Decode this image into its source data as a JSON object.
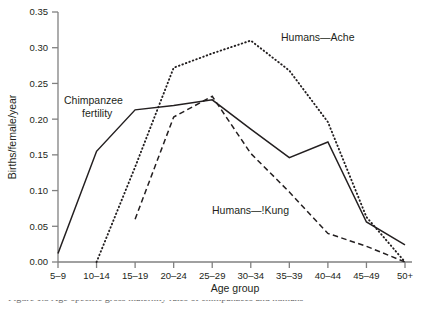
{
  "chart_data": {
    "type": "line",
    "title": "",
    "xlabel": "Age group",
    "ylabel": "Births/female/year",
    "categories": [
      "5–9",
      "10–14",
      "15–19",
      "20–24",
      "25–29",
      "30–34",
      "35–39",
      "40–44",
      "45–49",
      "50+"
    ],
    "ylim": [
      0.0,
      0.35
    ],
    "yticks": [
      "0.00",
      "0.05",
      "0.10",
      "0.15",
      "0.20",
      "0.25",
      "0.30",
      "0.35"
    ],
    "ytick_values": [
      0.0,
      0.05,
      0.1,
      0.15,
      0.2,
      0.25,
      0.3,
      0.35
    ],
    "grid": false,
    "legend_position": "inline-annotations",
    "series": [
      {
        "name": "Chimpanzee fertility",
        "style": "solid",
        "color": "#231f20",
        "x": [
          "5–9",
          "10–14",
          "15–19",
          "20–24",
          "25–29",
          "30–34",
          "35–39",
          "40–44",
          "45–49",
          "50+"
        ],
        "values": [
          0.012,
          0.155,
          0.213,
          0.219,
          0.227,
          0.186,
          0.146,
          0.168,
          0.056,
          0.024
        ]
      },
      {
        "name": "Humans—Ache",
        "style": "dotted",
        "color": "#231f20",
        "x": [
          "10–14",
          "15–19",
          "20–24",
          "25–29",
          "30–34",
          "35–39",
          "40–44",
          "45–49",
          "50+"
        ],
        "values": [
          0.0,
          0.133,
          0.272,
          0.292,
          0.31,
          0.268,
          0.196,
          0.063,
          0.0
        ]
      },
      {
        "name": "Humans—!Kung",
        "style": "dashed",
        "color": "#231f20",
        "x": [
          "15–19",
          "20–24",
          "25–29",
          "30–34",
          "35–39",
          "40–44",
          "45–49",
          "50+"
        ],
        "values": [
          0.06,
          0.203,
          0.232,
          0.152,
          0.098,
          0.04,
          0.022,
          0.0
        ]
      }
    ],
    "annotations": [
      {
        "text": "Chimpanzee",
        "x_px": 64,
        "y_px": 104
      },
      {
        "text": "fertility",
        "x_px": 82,
        "y_px": 117
      },
      {
        "text": "Humans—Ache",
        "x_px": 281,
        "y_px": 41
      },
      {
        "text": "Humans—!Kung",
        "x_px": 212,
        "y_px": 214
      }
    ]
  },
  "axes": {
    "x_title": "Age group",
    "y_title": "Births/female/year"
  },
  "caption": {
    "text": "Figure 1.5  Age-specific gross maternity rates of chimpanzees and humans"
  }
}
